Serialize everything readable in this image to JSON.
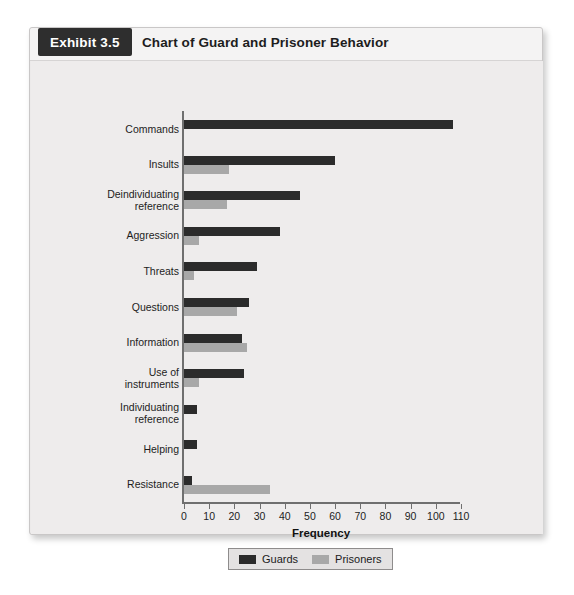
{
  "exhibit": {
    "tab_label": "Exhibit 3.5",
    "title": "Chart of Guard and Prisoner Behavior"
  },
  "colors": {
    "guards": "#2b2b2b",
    "prisoners": "#a8a8a8",
    "card_background": "#eceaea",
    "panel_background": "#eeecec",
    "axis": "#6f6f6f",
    "tab_background": "#2e2e2e"
  },
  "chart_data": {
    "type": "bar",
    "orientation": "horizontal",
    "title": "Chart of Guard and Prisoner Behavior",
    "xlabel": "Frequency",
    "ylabel": "",
    "xlim": [
      0,
      110
    ],
    "xticks": [
      0,
      10,
      20,
      30,
      40,
      50,
      60,
      70,
      80,
      90,
      100,
      110
    ],
    "grid": false,
    "legend_position": "bottom",
    "categories": [
      "Commands",
      "Insults",
      "Deindividuating\nreference",
      "Aggression",
      "Threats",
      "Questions",
      "Information",
      "Use of\ninstruments",
      "Individuating\nreference",
      "Helping",
      "Resistance"
    ],
    "series": [
      {
        "name": "Guards",
        "color": "#2b2b2b",
        "values": [
          107,
          60,
          46,
          38,
          29,
          26,
          23,
          24,
          5,
          5,
          3
        ]
      },
      {
        "name": "Prisoners",
        "color": "#a8a8a8",
        "values": [
          0,
          18,
          17,
          6,
          4,
          21,
          25,
          6,
          0,
          0,
          34
        ]
      }
    ]
  },
  "legend": {
    "items": [
      {
        "label": "Guards",
        "key": "guards"
      },
      {
        "label": "Prisoners",
        "key": "prisoners"
      }
    ]
  }
}
